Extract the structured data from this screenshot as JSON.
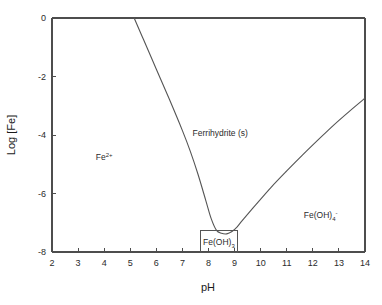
{
  "figure": {
    "kind": "solubility-diagram",
    "background_color": "#ffffff",
    "line_color": "#555555",
    "axis_color": "#4d4d4d",
    "text_color": "#2b2b2b"
  },
  "axes": {
    "x_title": "pH",
    "y_title": "Log [Fe]",
    "x_ticks": [
      "2",
      "3",
      "4",
      "5",
      "6",
      "7",
      "8",
      "9",
      "10",
      "11",
      "12",
      "13",
      "14"
    ],
    "y_ticks": [
      "0",
      "-2",
      "-4",
      "-6",
      "-8"
    ]
  },
  "species": {
    "ferrous": {
      "base": "Fe",
      "sup": "2+",
      "sub": ""
    },
    "ferrihydrite": {
      "base": "Ferrihydrite (s)",
      "sup": "",
      "sub": ""
    },
    "hydroxide_solid": {
      "base_a": "Fe(OH)",
      "sub": "3",
      "base_b": ""
    },
    "tetrahydroxo": {
      "base_a": "Fe(OH)",
      "sub": "4",
      "sup": "-"
    }
  },
  "chart_data": {
    "type": "line",
    "title": "",
    "xlabel": "pH",
    "ylabel": "Log [Fe]",
    "xlim": [
      2,
      14
    ],
    "ylim": [
      -8,
      0
    ],
    "grid": false,
    "legend": null,
    "annotations": [
      {
        "text": "Fe2+",
        "x": 4.0,
        "y": -4.85,
        "role": "stability-field-label"
      },
      {
        "text": "Ferrihydrite (s)",
        "x": 8.45,
        "y": -4.05,
        "role": "stability-field-label"
      },
      {
        "text": "Fe(OH)3",
        "x": 8.4,
        "y": -7.75,
        "role": "boxed-field-label"
      },
      {
        "text": "Fe(OH)4-",
        "x": 12.3,
        "y": -6.85,
        "role": "stability-field-label"
      }
    ],
    "callout_box": {
      "x0": 7.7,
      "x1": 9.1,
      "y0": -8.0,
      "y1": -7.25
    },
    "series": [
      {
        "name": "Fe(II)/Fe(III) solubility boundary (left branch)",
        "comment": "Descending branch bounding Fe2+ field; slope approx -2 per pH unit",
        "x": [
          5.15,
          5.5,
          6.0,
          6.5,
          7.0,
          7.3,
          7.6,
          7.9,
          8.1,
          8.3
        ],
        "y": [
          0.0,
          -0.72,
          -1.75,
          -2.78,
          -3.85,
          -4.55,
          -5.35,
          -6.25,
          -6.85,
          -7.25
        ]
      },
      {
        "name": "Ferrihydrite solubility minimum (basin)",
        "comment": "Flat minimum of the solubility curve near pH 8.1-8.7",
        "x": [
          8.3,
          8.5,
          8.7,
          8.9,
          9.1,
          9.3
        ],
        "y": [
          -7.25,
          -7.36,
          -7.38,
          -7.3,
          -7.14,
          -6.92
        ]
      },
      {
        "name": "Fe(OH)4- solubility boundary (right branch)",
        "comment": "Ascending branch bounding Fe(OH)4- field; slope approx +1 per pH unit",
        "x": [
          9.3,
          9.8,
          10.4,
          11.0,
          11.6,
          12.2,
          12.8,
          13.4,
          14.0
        ],
        "y": [
          -6.92,
          -6.4,
          -5.79,
          -5.23,
          -4.69,
          -4.17,
          -3.66,
          -3.19,
          -2.74
        ]
      }
    ]
  }
}
